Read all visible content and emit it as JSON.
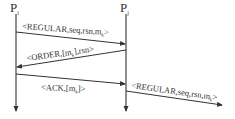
{
  "diagram": {
    "type": "sequence",
    "processes": [
      {
        "id": "Pi",
        "label": "P",
        "subscript": "i",
        "x": 16
      },
      {
        "id": "Pj",
        "label": "P",
        "subscript": "j",
        "x": 126
      }
    ],
    "messages": [
      {
        "from": "Pi",
        "to": "Pj",
        "parts": [
          "<REGULAR,seq,rsn,m",
          "k",
          ">"
        ]
      },
      {
        "from": "Pj",
        "to": "Pi",
        "parts": [
          "<ORDER,[m",
          "k",
          "],rsn>"
        ]
      },
      {
        "from": "Pi",
        "to": "Pj",
        "parts": [
          "<ACK,[m",
          "k",
          "]>"
        ]
      },
      {
        "from": "Pj",
        "to": "out",
        "parts": [
          "<REGULAR,seq,rsn,m",
          "k",
          ">"
        ]
      }
    ],
    "colors": {
      "line": "#333333",
      "background": "#ffffff"
    }
  }
}
